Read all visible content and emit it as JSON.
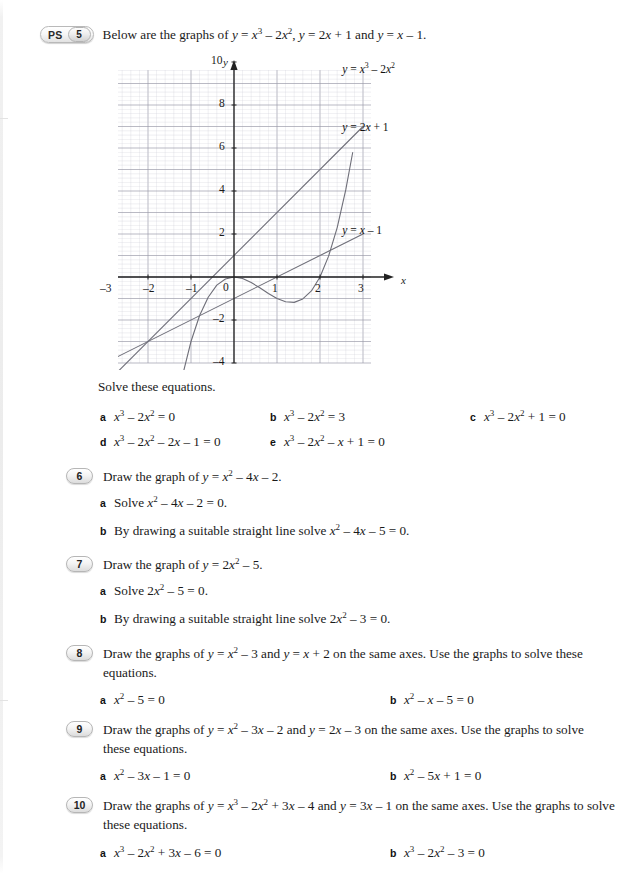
{
  "page": {
    "width": 640,
    "height": 874,
    "background": "#ffffff"
  },
  "questions": [
    {
      "id": "q5",
      "badge_ps": "PS",
      "number": "5",
      "stem_html": "Below are the graphs of <i>y</i> = <i>x</i><sup>3</sup> &ndash; 2<i>x</i><sup>2</sup>, <i>y</i> = 2<i>x</i> + 1 and <i>y</i> = <i>x</i> &ndash; 1.",
      "instruction": "Solve these equations.",
      "parts": [
        {
          "letter": "a",
          "text_html": "<i>x</i><sup>3</sup> &ndash; 2<i>x</i><sup>2</sup> = 0"
        },
        {
          "letter": "b",
          "text_html": "<i>x</i><sup>3</sup> &ndash; 2<i>x</i><sup>2</sup> = 3"
        },
        {
          "letter": "c",
          "text_html": "<i>x</i><sup>3</sup> &ndash; 2<i>x</i><sup>2</sup> + 1 = 0"
        },
        {
          "letter": "d",
          "text_html": "<i>x</i><sup>3</sup> &ndash; 2<i>x</i><sup>2</sup> &ndash; 2<i>x</i> &ndash; 1 = 0"
        },
        {
          "letter": "e",
          "text_html": "<i>x</i><sup>3</sup> &ndash; 2<i>x</i><sup>2</sup> &ndash; <i>x</i> + 1 = 0"
        }
      ]
    },
    {
      "id": "q6",
      "number": "6",
      "stem_html": "Draw the graph of <i>y</i> = <i>x</i><sup>2</sup> &ndash; 4<i>x</i> &ndash; 2.",
      "parts": [
        {
          "letter": "a",
          "text_html": "Solve <i>x</i><sup>2</sup> &ndash; 4<i>x</i> &ndash; 2 = 0."
        },
        {
          "letter": "b",
          "text_html": "By drawing a suitable straight line solve <i>x</i><sup>2</sup> &ndash; 4<i>x</i> &ndash; 5 = 0."
        }
      ]
    },
    {
      "id": "q7",
      "number": "7",
      "stem_html": "Draw the graph of <i>y</i> = 2<i>x</i><sup>2</sup> &ndash; 5.",
      "parts": [
        {
          "letter": "a",
          "text_html": "Solve 2<i>x</i><sup>2</sup> &ndash; 5 = 0."
        },
        {
          "letter": "b",
          "text_html": "By drawing a suitable straight line solve 2<i>x</i><sup>2</sup> &ndash; 3 = 0."
        }
      ]
    },
    {
      "id": "q8",
      "number": "8",
      "stem_html": "Draw the graphs of <i>y</i> = <i>x</i><sup>2</sup> &ndash; 3 and <i>y</i> = <i>x</i> + 2 on the same axes. Use the graphs to solve these equations.",
      "parts": [
        {
          "letter": "a",
          "text_html": "<i>x</i><sup>2</sup> &ndash; 5 = 0"
        },
        {
          "letter": "b",
          "text_html": "<i>x</i><sup>2</sup> &ndash; <i>x</i> &ndash; 5 = 0"
        }
      ]
    },
    {
      "id": "q9",
      "number": "9",
      "stem_html": "Draw the graphs of <i>y</i> = <i>x</i><sup>2</sup> &ndash; 3<i>x</i> &ndash; 2 and <i>y</i> = 2<i>x</i> &ndash; 3 on the same axes. Use the graphs to solve these equations.",
      "parts": [
        {
          "letter": "a",
          "text_html": "<i>x</i><sup>2</sup> &ndash; 3<i>x</i> &ndash; 1 = 0"
        },
        {
          "letter": "b",
          "text_html": "<i>x</i><sup>2</sup> &ndash; 5<i>x</i> + 1 = 0"
        }
      ]
    },
    {
      "id": "q10",
      "number": "10",
      "stem_html": "Draw the graphs of <i>y</i> = <i>x</i><sup>3</sup> &ndash; 2<i>x</i><sup>2</sup> + 3<i>x</i> &ndash; 4 and <i>y</i> = 3<i>x</i> &ndash; 1 on the same axes. Use the graphs to solve these equations.",
      "parts": [
        {
          "letter": "a",
          "text_html": "<i>x</i><sup>3</sup> &ndash; 2<i>x</i><sup>2</sup> + 3<i>x</i> &ndash; 6 = 0"
        },
        {
          "letter": "b",
          "text_html": "<i>x</i><sup>3</sup> &ndash; 2<i>x</i><sup>2</sup> &ndash; 3 = 0"
        }
      ]
    }
  ],
  "chart_data": {
    "type": "line",
    "title": "",
    "xlabel": "x",
    "ylabel": "y",
    "xlim": [
      -3.7,
      3.2
    ],
    "ylim": [
      -5.3,
      11.3
    ],
    "grid": true,
    "minor_grid_divisions": 5,
    "xticks": [
      -3,
      -2,
      -1,
      1,
      2,
      3
    ],
    "yticks": [
      -4,
      -2,
      2,
      4,
      6,
      8,
      10
    ],
    "origin_label": "0",
    "grid_color": "#c9c9d4",
    "major_grid_color": "#9a9aa8",
    "axis_color": "#222222",
    "curve_color": "#6e6e78",
    "series": [
      {
        "name": "cubic",
        "label": "y = x³ – 2x²",
        "label_html": "<i>y</i> = <i>x</i><sup>3</sup> &ndash; 2<i>x</i><sup>2</sup>",
        "expression": "x^3 - 2x^2",
        "label_pos": [
          2.45,
          9.6
        ],
        "x": [
          -1.55,
          -1.4,
          -1.2,
          -1.0,
          -0.8,
          -0.6,
          -0.4,
          -0.2,
          0.0,
          0.2,
          0.4,
          0.6,
          0.8,
          1.0,
          1.2,
          1.4,
          1.6,
          1.8,
          2.0,
          2.2,
          2.4,
          2.6,
          2.76
        ],
        "y": [
          -8.53,
          -6.66,
          -4.61,
          -3.0,
          -1.79,
          -0.94,
          -0.38,
          -0.09,
          0.0,
          -0.07,
          -0.26,
          -0.5,
          -0.77,
          -1.0,
          -1.15,
          -1.18,
          -1.02,
          -0.65,
          0.0,
          0.97,
          2.3,
          4.06,
          5.79
        ]
      },
      {
        "name": "line1",
        "label": "y = 2x + 1",
        "label_html": "<i>y</i> = 2<i>x</i> + 1",
        "expression": "2x + 1",
        "label_pos": [
          2.45,
          6.9
        ],
        "x": [
          -3.0,
          3.0
        ],
        "y": [
          -5.0,
          7.0
        ]
      },
      {
        "name": "line2",
        "label": "y = x – 1",
        "label_html": "<i>y</i> = <i>x</i> &ndash; 1",
        "expression": "x - 1",
        "label_pos": [
          2.45,
          2.1
        ],
        "x": [
          -3.6,
          3.0
        ],
        "y": [
          -4.6,
          2.0
        ]
      }
    ]
  }
}
